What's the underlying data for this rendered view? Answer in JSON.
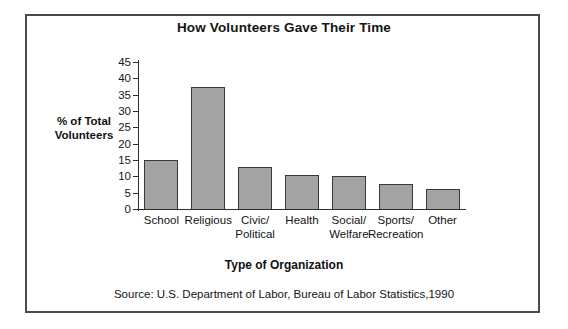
{
  "chart_data": {
    "type": "bar",
    "title": "How Volunteers Gave Their Time",
    "xlabel": "Type of Organization",
    "ylabel": "% of Total\nVolunteers",
    "ylabel_line1": "% of Total",
    "ylabel_line2": "Volunteers",
    "source": "Source: U.S. Department of Labor, Bureau of Labor Statistics,1990",
    "categories": [
      "School",
      "Religious",
      "Civic/\nPolitical",
      "Health",
      "Social/\nWelfare",
      "Sports/\nRecreation",
      "Other"
    ],
    "values": [
      15,
      37.5,
      13,
      10.3,
      10,
      7.8,
      6
    ],
    "ylim": [
      0,
      45
    ],
    "yticks": [
      0,
      5,
      10,
      15,
      20,
      25,
      30,
      35,
      40,
      45
    ],
    "ytick_labels": [
      "0",
      "5",
      "10",
      "15",
      "20",
      "25",
      "30",
      "35",
      "40",
      "45"
    ],
    "grid": false,
    "legend": null,
    "bar_color": "#a3a3a3",
    "bar_edge_color": "#3a3a3a",
    "axis_color": "#2e2e2e",
    "frame_color": "#4a4a4a"
  }
}
